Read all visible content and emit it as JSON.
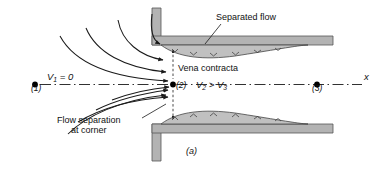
{
  "figure": {
    "caption": "(a)"
  },
  "labels": {
    "separated_flow": "Separated flow",
    "vena_contracta": "Vena contracta",
    "flow_separation_line1": "Flow separation",
    "flow_separation_line2": "at corner",
    "axis_x": "x"
  },
  "stations": {
    "point1_label": "(1)",
    "point2_label": "(2)",
    "point3_label": "(3)"
  },
  "equations": {
    "v1": "V",
    "v1_sub": "1",
    "v1_rest": " = 0",
    "v2": "V",
    "v2_sub": "2",
    "gt": " > ",
    "v3": "V",
    "v3_sub": "3"
  },
  "colors": {
    "wall_fill": "#b3b3b3",
    "wall_stroke": "#555555",
    "separation_fill": "#c0c0c0",
    "line": "#1a1a1a",
    "background": "#ffffff",
    "text": "#111111"
  }
}
